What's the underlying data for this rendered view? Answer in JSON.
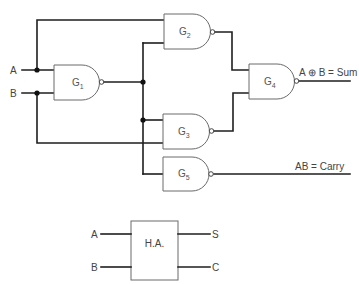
{
  "diagram": {
    "type": "logic-circuit",
    "inputs": {
      "a": "A",
      "b": "B"
    },
    "gates": [
      {
        "id": "G1",
        "letter": "G",
        "sub": "1",
        "kind": "NAND"
      },
      {
        "id": "G2",
        "letter": "G",
        "sub": "2",
        "kind": "NAND"
      },
      {
        "id": "G3",
        "letter": "G",
        "sub": "3",
        "kind": "NAND"
      },
      {
        "id": "G4",
        "letter": "G",
        "sub": "4",
        "kind": "NAND"
      },
      {
        "id": "G5",
        "letter": "G",
        "sub": "5",
        "kind": "NAND"
      }
    ],
    "outputs": {
      "sum": "A ⊕ B = Sum",
      "carry": "AB = Carry"
    },
    "block": {
      "title": "H.A.",
      "in_a": "A",
      "in_b": "B",
      "out_s": "S",
      "out_c": "C"
    },
    "colors": {
      "wire": "#1e1e1e",
      "gate_outline": "#6a6a6a",
      "label": "#444444"
    }
  }
}
